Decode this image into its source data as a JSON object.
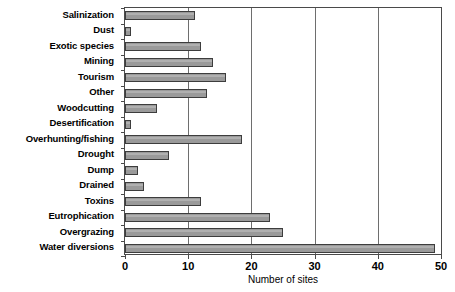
{
  "chart_data": {
    "type": "bar",
    "orientation": "horizontal",
    "title": "",
    "xlabel": "Number of sites",
    "ylabel": "",
    "xlim": [
      0,
      50
    ],
    "xticks": [
      0,
      10,
      20,
      30,
      40,
      50
    ],
    "grid": "vertical",
    "legend": "none",
    "bar_color": "#9a9a9a",
    "bar_edge_color": "#3d3d3d",
    "axis_color": "#4a4a4a",
    "categories": [
      "Salinization",
      "Dust",
      "Exotic species",
      "Mining",
      "Tourism",
      "Other",
      "Woodcutting",
      "Desertification",
      "Overhunting/fishing",
      "Drought",
      "Dump",
      "Drained",
      "Toxins",
      "Eutrophication",
      "Overgrazing",
      "Water diversions"
    ],
    "values": [
      11,
      1,
      12,
      14,
      16,
      13,
      5,
      1,
      18.5,
      7,
      2,
      3,
      12,
      23,
      25,
      49
    ]
  }
}
